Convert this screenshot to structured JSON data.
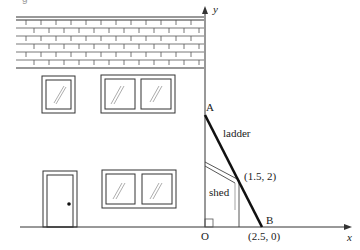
{
  "figure": {
    "top_crop_fragment": "g",
    "axes": {
      "x_label": "x",
      "y_label": "y",
      "origin_label": "O"
    },
    "points": {
      "A": {
        "label": "A"
      },
      "B": {
        "label": "B",
        "coords": "(2.5, 0)"
      },
      "contact": {
        "coords": "(1.5, 2)"
      }
    },
    "labels": {
      "ladder": "ladder",
      "shed": "shed"
    },
    "colors": {
      "ink": "#1a1a1a",
      "background": "#ffffff"
    }
  }
}
